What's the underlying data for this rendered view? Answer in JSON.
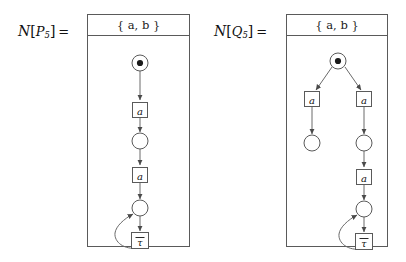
{
  "figure": {
    "width": 406,
    "height": 262,
    "background": "#ffffff",
    "stroke_color": "#5a5a5a",
    "text_color": "#111111"
  },
  "panels": [
    {
      "id": "left",
      "label": {
        "calligraphic_n": "N",
        "open_bracket": "[",
        "process": "P",
        "subscript": "5",
        "close_bracket": "]",
        "equals": "="
      },
      "label_text": "N[P5] =",
      "box": {
        "x": 87,
        "y": 14,
        "width": 103,
        "height": 233
      },
      "header": {
        "text": "{ a, b }",
        "open": "{",
        "items": "a, b",
        "close": "}"
      },
      "net": {
        "type": "petri-net",
        "places": [
          {
            "id": "p0",
            "cx": 139,
            "cy": 62,
            "r": 8,
            "marked": true,
            "tokens": 1
          },
          {
            "id": "p1",
            "cx": 139,
            "cy": 126,
            "r": 8,
            "marked": false,
            "tokens": 0
          },
          {
            "id": "p2",
            "cx": 139,
            "cy": 193,
            "r": 8,
            "marked": false,
            "tokens": 0
          }
        ],
        "transitions": [
          {
            "id": "t0",
            "cx": 139,
            "cy": 94,
            "w": 15,
            "h": 15,
            "label": "a"
          },
          {
            "id": "t1",
            "cx": 139,
            "cy": 159,
            "w": 15,
            "h": 15,
            "label": "a"
          },
          {
            "id": "t2",
            "cx": 139,
            "cy": 225,
            "w": 17,
            "h": 16,
            "label": "τ",
            "overbar": true
          }
        ],
        "arcs": [
          {
            "from": "p0",
            "to": "t0",
            "kind": "straight"
          },
          {
            "from": "t0",
            "to": "p1",
            "kind": "straight"
          },
          {
            "from": "p1",
            "to": "t1",
            "kind": "straight"
          },
          {
            "from": "t1",
            "to": "p2",
            "kind": "straight"
          },
          {
            "from": "p2",
            "to": "t2",
            "kind": "straight"
          },
          {
            "from": "t2",
            "to": "p2",
            "kind": "loop-left"
          }
        ]
      }
    },
    {
      "id": "right",
      "label": {
        "calligraphic_n": "N",
        "open_bracket": "[",
        "process": "Q",
        "subscript": "5",
        "close_bracket": "]",
        "equals": "="
      },
      "label_text": "N[Q5] =",
      "box": {
        "x": 286,
        "y": 14,
        "width": 102,
        "height": 233
      },
      "header": {
        "text": "{ a, b }",
        "open": "{",
        "items": "a, b",
        "close": "}"
      },
      "net": {
        "type": "petri-net",
        "places": [
          {
            "id": "p0",
            "cx": 337,
            "cy": 60,
            "r": 8,
            "marked": true,
            "tokens": 1
          },
          {
            "id": "pl1",
            "cx": 311,
            "cy": 128,
            "r": 8,
            "marked": false,
            "tokens": 0
          },
          {
            "id": "pr1",
            "cx": 363,
            "cy": 128,
            "r": 8,
            "marked": false,
            "tokens": 0
          },
          {
            "id": "pr2",
            "cx": 363,
            "cy": 194,
            "r": 8,
            "marked": false,
            "tokens": 0
          }
        ],
        "transitions": [
          {
            "id": "tl",
            "cx": 311,
            "cy": 97,
            "w": 15,
            "h": 15,
            "label": "a"
          },
          {
            "id": "tr",
            "cx": 363,
            "cy": 97,
            "w": 15,
            "h": 15,
            "label": "a"
          },
          {
            "id": "tr2",
            "cx": 363,
            "cy": 161,
            "w": 15,
            "h": 15,
            "label": "a"
          },
          {
            "id": "tr3",
            "cx": 363,
            "cy": 226,
            "w": 17,
            "h": 16,
            "label": "τ",
            "overbar": true
          }
        ],
        "arcs": [
          {
            "from": "p0",
            "to": "tl",
            "kind": "diagonal"
          },
          {
            "from": "p0",
            "to": "tr",
            "kind": "diagonal"
          },
          {
            "from": "tl",
            "to": "pl1",
            "kind": "straight"
          },
          {
            "from": "tr",
            "to": "pr1",
            "kind": "straight"
          },
          {
            "from": "pr1",
            "to": "tr2",
            "kind": "straight"
          },
          {
            "from": "tr2",
            "to": "pr2",
            "kind": "straight"
          },
          {
            "from": "pr2",
            "to": "tr3",
            "kind": "straight"
          },
          {
            "from": "tr3",
            "to": "pr2",
            "kind": "loop-left"
          }
        ]
      }
    }
  ]
}
